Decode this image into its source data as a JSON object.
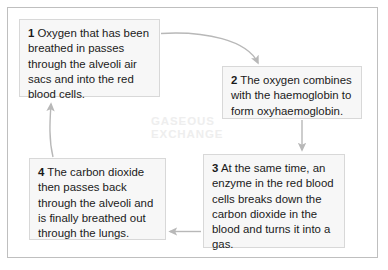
{
  "diagram": {
    "title_watermark": "GASEOUS\nEXCHANGE",
    "border_color": "#bfbfbf",
    "box_fill": "#f7f7f7",
    "box_border": "#d8d8d8",
    "arrow_color": "#b8b8b8",
    "text_color": "#1a1a1a",
    "watermark_color": "#eeeeee"
  },
  "steps": [
    {
      "number": "1",
      "text": " Oxygen that has been breathed in passes through the alveoli air sacs and into the red blood cells."
    },
    {
      "number": "2",
      "text": " The oxygen combines with the haemoglobin to form oxyhaemoglobin."
    },
    {
      "number": "3",
      "text": " At the same time, an enzyme in the red blood cells breaks down the carbon dioxide in the blood and turns it into a gas."
    },
    {
      "number": "4",
      "text": " The carbon dioxide then passes back through the alveoli and is finally breathed out through the lungs."
    }
  ],
  "connectors": [
    {
      "name": "arrow-step1-to-step2",
      "from": "1",
      "to": "2"
    },
    {
      "name": "arrow-step2-to-step3",
      "from": "2",
      "to": "3"
    },
    {
      "name": "arrow-step3-to-step4",
      "from": "3",
      "to": "4"
    },
    {
      "name": "arrow-step4-to-step1",
      "from": "4",
      "to": "1"
    }
  ]
}
